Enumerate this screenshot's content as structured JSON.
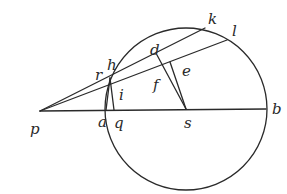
{
  "diagram": {
    "circle": {
      "cx": 186,
      "cy": 109,
      "r": 81
    },
    "points": {
      "p": [
        40,
        111
      ],
      "b": [
        266,
        109
      ],
      "s": [
        186,
        109
      ],
      "a": [
        106,
        110
      ],
      "q": [
        114,
        110
      ],
      "r": [
        110,
        78
      ],
      "k": [
        205,
        28
      ],
      "l": [
        227,
        40
      ],
      "d": [
        157,
        55
      ],
      "e": [
        170,
        62
      ]
    },
    "labels": [
      {
        "id": "k",
        "text": "k",
        "x": 208,
        "y": 24
      },
      {
        "id": "l",
        "text": "l",
        "x": 232,
        "y": 36
      },
      {
        "id": "d",
        "text": "d",
        "x": 150,
        "y": 55
      },
      {
        "id": "h",
        "text": "h",
        "x": 107,
        "y": 70
      },
      {
        "id": "r",
        "text": "r",
        "x": 95,
        "y": 80
      },
      {
        "id": "e",
        "text": "e",
        "x": 182,
        "y": 76
      },
      {
        "id": "f",
        "text": "f",
        "x": 153,
        "y": 90
      },
      {
        "id": "i",
        "text": "i",
        "x": 119,
        "y": 100
      },
      {
        "id": "p",
        "text": "p",
        "x": 30,
        "y": 134
      },
      {
        "id": "a",
        "text": "a",
        "x": 98,
        "y": 127
      },
      {
        "id": "q",
        "text": "q",
        "x": 114,
        "y": 128
      },
      {
        "id": "s",
        "text": "s",
        "x": 184,
        "y": 128
      },
      {
        "id": "b",
        "text": "b",
        "x": 272,
        "y": 114
      }
    ]
  }
}
